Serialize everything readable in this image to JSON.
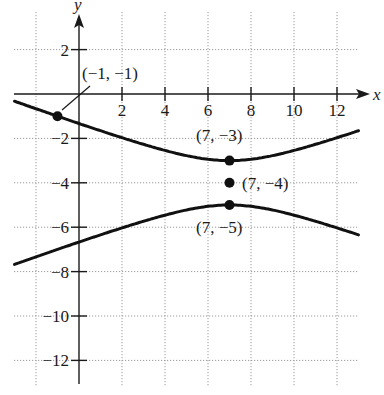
{
  "chart_data": {
    "type": "line",
    "title": "",
    "xlabel": "x",
    "ylabel": "y",
    "xlim": [
      -3,
      13.5
    ],
    "ylim": [
      -13,
      3.5
    ],
    "grid": true,
    "x_ticks": [
      2,
      4,
      6,
      8,
      10,
      12
    ],
    "x_tick_labels": [
      "2",
      "4",
      "6",
      "8",
      "10",
      "12"
    ],
    "y_ticks": [
      2,
      -2,
      -4,
      -6,
      -8,
      -10,
      -12
    ],
    "y_tick_labels": [
      "2",
      "−2",
      "−4",
      "−6",
      "−8",
      "−10",
      "−12"
    ],
    "grid_x": [
      -2,
      2,
      4,
      6,
      8,
      10,
      12
    ],
    "grid_y": [
      2,
      -2,
      -4,
      -6,
      -8,
      -10,
      -12
    ],
    "equation": "(y+4)^2/1 - (x-7)^2/8 = 1",
    "series": [
      {
        "name": "upper branch",
        "center": [
          7,
          -4
        ],
        "a": 1,
        "b2": 8,
        "branch": "upper",
        "x_range": [
          -3,
          13
        ]
      },
      {
        "name": "lower branch",
        "center": [
          7,
          -4
        ],
        "a": 1,
        "b2": 8,
        "branch": "lower",
        "x_range": [
          -3,
          13
        ]
      }
    ],
    "points": [
      {
        "x": -1,
        "y": -1,
        "label": "(−1, −1)"
      },
      {
        "x": 7,
        "y": -3,
        "label": "(7, −3)"
      },
      {
        "x": 7,
        "y": -4,
        "label": "(7, −4)"
      },
      {
        "x": 7,
        "y": -5,
        "label": "(7, −5)"
      }
    ]
  },
  "labels": {
    "x_axis": "x",
    "y_axis": "y",
    "pt_neg1": "(−1, −1)",
    "pt_vertex_top": "(7, −3)",
    "pt_center": "(7, −4)",
    "pt_vertex_bottom": "(7, −5)"
  }
}
